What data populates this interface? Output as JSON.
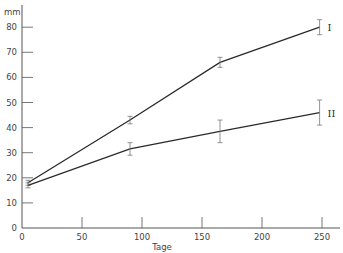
{
  "chart_data": {
    "type": "line",
    "title": "",
    "xlabel": "Tage",
    "ylabel": "mm",
    "xlim": [
      0,
      265
    ],
    "ylim": [
      0,
      85
    ],
    "x_ticks": [
      0,
      50,
      100,
      150,
      200,
      250
    ],
    "y_ticks": [
      0,
      10,
      20,
      30,
      40,
      50,
      60,
      70,
      80
    ],
    "grid": false,
    "legend": "inline labels at line ends",
    "series": [
      {
        "name": "I",
        "x": [
          5,
          90,
          165,
          248
        ],
        "values": [
          18,
          43,
          66,
          80
        ],
        "error": [
          1,
          1.5,
          2,
          3
        ]
      },
      {
        "name": "II",
        "x": [
          5,
          90,
          165,
          248
        ],
        "values": [
          17,
          31.5,
          38.5,
          46
        ],
        "error": [
          1,
          2.5,
          4.5,
          5
        ]
      }
    ],
    "colors": {
      "line": "#2a2a2a",
      "axis": "#555555",
      "error_bar": "#777777"
    }
  }
}
